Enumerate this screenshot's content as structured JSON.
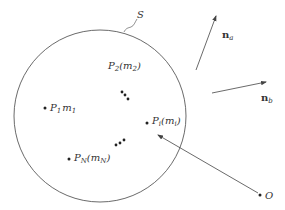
{
  "diagram": {
    "colors": {
      "stroke": "#444444",
      "text": "#333333",
      "background": "#ffffff"
    },
    "surface": {
      "label": "S",
      "cx": 100,
      "cy": 116,
      "r": 86
    },
    "particles": [
      {
        "id": "P1",
        "base": "P",
        "sub": "1",
        "text_suffix": "m",
        "mass_sub": "1",
        "display": "P1m1",
        "x": 45,
        "y": 108
      },
      {
        "id": "P2",
        "base": "P",
        "sub": "2",
        "display": "P2(m2)",
        "label_x": 98,
        "label_y": 66
      },
      {
        "id": "Pi",
        "base": "P",
        "sub": "i",
        "display": "Pi(mi)",
        "x": 147,
        "y": 123
      },
      {
        "id": "PN",
        "base": "P",
        "sub": "N",
        "display": "PN(mN)",
        "x": 69,
        "y": 159
      }
    ],
    "ellipsis_dots": [
      [
        [
          122,
          92
        ],
        [
          125,
          95
        ],
        [
          128,
          99
        ]
      ],
      [
        [
          116,
          145
        ],
        [
          120,
          143
        ],
        [
          124,
          140
        ]
      ]
    ],
    "origin": {
      "label": "O",
      "x": 260,
      "y": 195
    },
    "vectors": [
      {
        "label": "n",
        "sub": "a",
        "display": "na",
        "from": [
          196,
          70
        ],
        "to": [
          216,
          16
        ]
      },
      {
        "label": "n",
        "sub": "b",
        "display": "nb",
        "from": [
          212,
          93
        ],
        "to": [
          266,
          82
        ]
      }
    ],
    "labels": {
      "S": "S",
      "P1": "P",
      "P1_sub": "1",
      "P1_m": "m",
      "P1_msub": "1",
      "P2": "P",
      "P2_sub": "2",
      "P2_open": "(m",
      "P2_msub": "2",
      "P2_close": ")",
      "Pi": "P",
      "Pi_sub": "i",
      "Pi_open": "(m",
      "Pi_msub": "i",
      "Pi_close": ")",
      "PN": "P",
      "PN_sub": "N",
      "PN_open": "(m",
      "PN_msub": "N",
      "PN_close": ")",
      "O": "O",
      "na": "n",
      "na_sub": "a",
      "nb": "n",
      "nb_sub": "b"
    }
  }
}
